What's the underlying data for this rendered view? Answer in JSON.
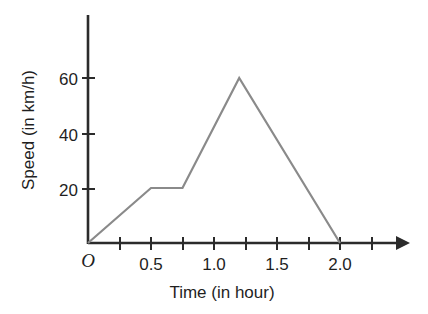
{
  "chart_data": {
    "type": "line",
    "title": "",
    "xlabel": "Time (in hour)",
    "ylabel": "Speed (in km/h)",
    "origin_label": "O",
    "x": [
      0,
      0.5,
      0.75,
      1.2,
      2.0
    ],
    "values": [
      0,
      20,
      20,
      60,
      0
    ],
    "series": [
      {
        "name": "Speed",
        "points": [
          {
            "x": 0,
            "y": 0
          },
          {
            "x": 0.5,
            "y": 20
          },
          {
            "x": 0.75,
            "y": 20
          },
          {
            "x": 1.2,
            "y": 60
          },
          {
            "x": 2.0,
            "y": 0
          }
        ],
        "color": "#8a8a8a"
      }
    ],
    "xlim": [
      0,
      2.25
    ],
    "ylim": [
      0,
      75
    ],
    "x_tick_values": [
      0,
      0.25,
      0.5,
      0.75,
      1.0,
      1.25,
      1.5,
      1.75,
      2.0,
      2.25
    ],
    "x_tick_labels": [
      "",
      "",
      "0.5",
      "",
      "1.0",
      "",
      "1.5",
      "",
      "2.0",
      ""
    ],
    "y_tick_values": [
      20,
      40,
      60
    ],
    "y_tick_labels": [
      "20",
      "40",
      "60"
    ],
    "grid": false,
    "legend": false,
    "axis_color": "#2b2b2b"
  },
  "axis_labels": {
    "x_title": "Time (in hour)",
    "y_title": "Speed (in km/h)",
    "origin": "O"
  },
  "x_ticks": [
    {
      "label": "0.5"
    },
    {
      "label": "1.0"
    },
    {
      "label": "1.5"
    },
    {
      "label": "2.0"
    }
  ],
  "y_ticks": [
    {
      "label": "60"
    },
    {
      "label": "40"
    },
    {
      "label": "20"
    }
  ]
}
